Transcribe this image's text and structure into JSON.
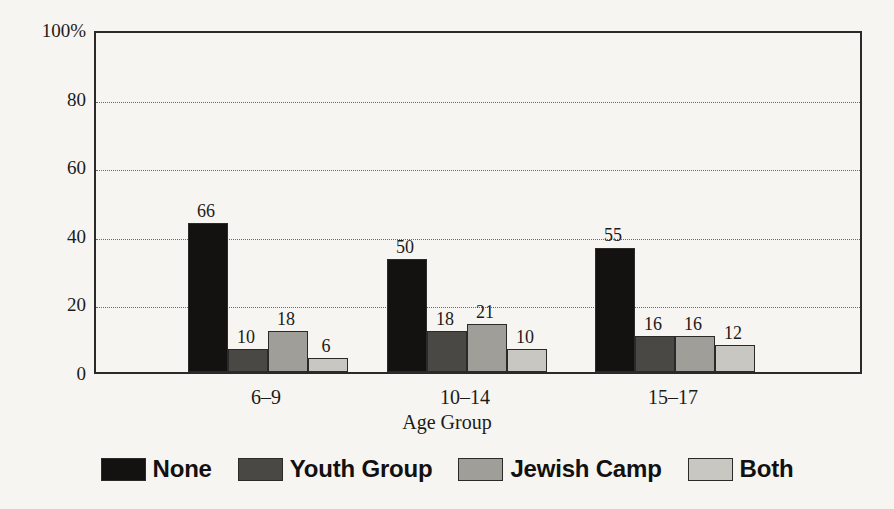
{
  "chart_data": {
    "type": "bar",
    "title": "",
    "xlabel": "Age Group",
    "ylabel": "",
    "categories": [
      "6–9",
      "10–14",
      "15–17"
    ],
    "series": [
      {
        "name": "None",
        "values": [
          66,
          50,
          55
        ],
        "color": "#131210"
      },
      {
        "name": "Youth Group",
        "values": [
          10,
          18,
          16
        ],
        "color": "#4a4845"
      },
      {
        "name": "Jewish Camp",
        "values": [
          18,
          21,
          16
        ],
        "color": "#a09e99"
      },
      {
        "name": "Both",
        "values": [
          6,
          10,
          12
        ],
        "color": "#c9c7c1"
      }
    ],
    "ylim": [
      0,
      100
    ],
    "yticks": [
      0,
      20,
      40,
      60,
      80,
      100
    ],
    "ytick_labels": [
      "0",
      "20",
      "40",
      "60",
      "80",
      "100%"
    ],
    "gridlines": [
      20,
      40,
      60,
      80
    ],
    "grid": true,
    "legend_position": "bottom",
    "value_labels": true
  },
  "axis": {
    "y_labels": [
      "100%",
      "80",
      "60",
      "40",
      "20",
      "0"
    ],
    "x_title": "Age Group"
  },
  "legend": {
    "items": [
      {
        "label": "None"
      },
      {
        "label": "Youth Group"
      },
      {
        "label": "Jewish Camp"
      },
      {
        "label": "Both"
      }
    ]
  }
}
